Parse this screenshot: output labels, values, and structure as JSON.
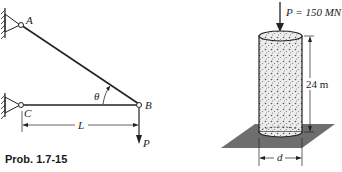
{
  "truss_figure": {
    "labels": {
      "A": "A",
      "B": "B",
      "C": "C",
      "theta": "θ",
      "L": "L",
      "P": "P"
    },
    "caption": "Prob. 1.7-15"
  },
  "column_figure": {
    "load_label": "P = 150 MN",
    "height_label": "24 m",
    "diameter_label": "d"
  },
  "colors": {
    "ink": "#222222",
    "ground": "#6e6e6e",
    "concrete": "#e8e8e8"
  }
}
